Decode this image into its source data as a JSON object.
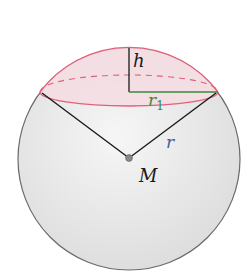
{
  "diagram": {
    "labels": {
      "height": "h",
      "cap_radius": "r",
      "cap_radius_sub": "1",
      "sphere_radius": "r",
      "center": "M"
    },
    "colors": {
      "cap_outline": "#e0607a",
      "cap_fill": "#f6e3e6",
      "sphere_fill": "#ececec",
      "sphere_outline": "#6a6a6a",
      "r1_line": "#3a8a3a",
      "r_label": "#3a5fa8",
      "lines": "#1a1a1a"
    }
  }
}
